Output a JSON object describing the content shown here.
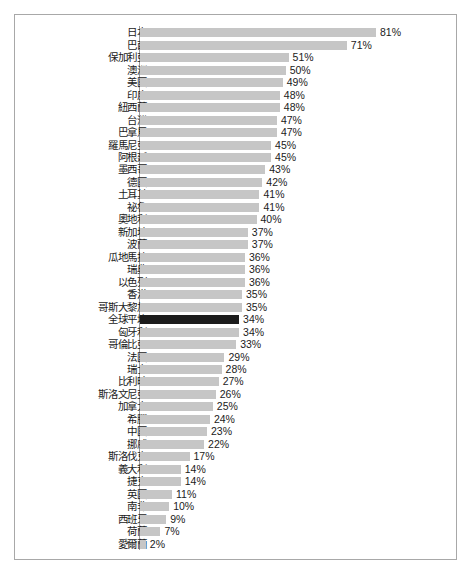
{
  "chart_data": {
    "type": "bar",
    "orientation": "horizontal",
    "title": "",
    "subtitle": "",
    "xlabel": "",
    "ylabel": "",
    "grid": false,
    "legend": null,
    "value_suffix": "%",
    "xlim": [
      0,
      81
    ],
    "highlight_category": "全球平均",
    "highlight_color": "#1c1c1c",
    "bar_color": "#c6c6c6",
    "categories": [
      "日本",
      "巴西",
      "保加利亞",
      "澳洲",
      "美國",
      "印度",
      "紐西蘭",
      "台灣",
      "巴拿馬",
      "羅馬尼亞",
      "阿根廷",
      "墨西哥",
      "德國",
      "土耳其",
      "祕魯",
      "奧地利",
      "新加坡",
      "波蘭",
      "瓜地馬拉",
      "瑞典",
      "以色列",
      "香港",
      "哥斯大黎加",
      "全球平均",
      "匈牙利",
      "哥倫比亞",
      "法國",
      "瑞士",
      "比利時",
      "斯洛文尼亞",
      "加拿大",
      "希臘",
      "中國",
      "挪威",
      "斯洛伐克",
      "義大利",
      "捷克",
      "英國",
      "南非",
      "西班牙",
      "荷蘭",
      "愛爾蘭"
    ],
    "values": [
      81,
      71,
      51,
      50,
      49,
      48,
      48,
      47,
      47,
      45,
      45,
      43,
      42,
      41,
      41,
      40,
      37,
      37,
      36,
      36,
      36,
      35,
      35,
      34,
      34,
      33,
      29,
      28,
      27,
      26,
      25,
      24,
      23,
      22,
      17,
      14,
      14,
      11,
      10,
      9,
      7,
      2
    ],
    "value_labels": [
      "81%",
      "71%",
      "51%",
      "50%",
      "49%",
      "48%",
      "48%",
      "47%",
      "47%",
      "45%",
      "45%",
      "43%",
      "42%",
      "41%",
      "41%",
      "40%",
      "37%",
      "37%",
      "36%",
      "36%",
      "36%",
      "35%",
      "35%",
      "34%",
      "34%",
      "33%",
      "29%",
      "28%",
      "27%",
      "26%",
      "25%",
      "24%",
      "23%",
      "22%",
      "17%",
      "14%",
      "14%",
      "11%",
      "10%",
      "9%",
      "7%",
      "2%"
    ]
  }
}
